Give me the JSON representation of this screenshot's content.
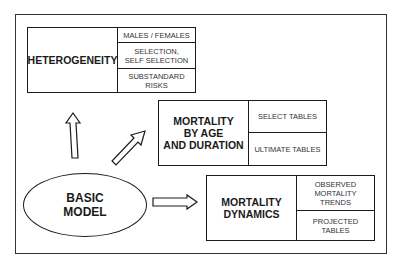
{
  "diagram": {
    "center": {
      "label": "BASIC\nMODEL"
    },
    "branches": [
      {
        "title": "HETEROGENEITY",
        "items": [
          "MALES / FEMALES",
          "SELECTION,\nSELF SELECTION",
          "SUBSTANDARD\nRISKS"
        ]
      },
      {
        "title": "MORTALITY\nBY AGE\nAND DURATION",
        "items": [
          "SELECT TABLES",
          "ULTIMATE TABLES"
        ]
      },
      {
        "title": "MORTALITY\nDYNAMICS",
        "items": [
          "OBSERVED\nMORTALITY\nTRENDS",
          "PROJECTED\nTABLES"
        ]
      }
    ],
    "arrows": [
      {
        "from": "BASIC MODEL",
        "to": "HETEROGENEITY",
        "direction": "up"
      },
      {
        "from": "BASIC MODEL",
        "to": "MORTALITY BY AGE AND DURATION",
        "direction": "up-right"
      },
      {
        "from": "BASIC MODEL",
        "to": "MORTALITY DYNAMICS",
        "direction": "right"
      }
    ],
    "colors": {
      "stroke": "#1a1a1a",
      "background": "#ffffff",
      "frame": "#333333"
    }
  }
}
